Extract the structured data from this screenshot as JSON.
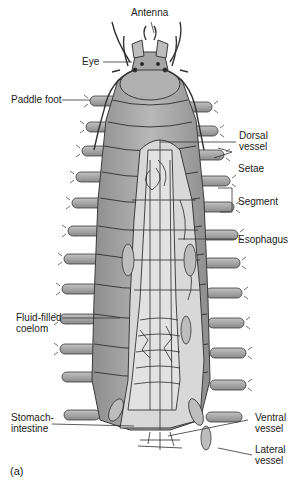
{
  "figure": {
    "panel_label": "(a)",
    "colors": {
      "body": "#a9a9a9",
      "body_shadow": "#8e8e8e",
      "interior": "#d6d6d6",
      "outline": "#3a3a3a",
      "vessel": "#2b2b2b",
      "label_text": "#222222"
    }
  },
  "labels": [
    {
      "id": "antenna",
      "text": "Antenna",
      "side": "top"
    },
    {
      "id": "eye",
      "text": "Eye",
      "side": "left"
    },
    {
      "id": "paddle_foot",
      "text": "Paddle foot",
      "side": "left"
    },
    {
      "id": "dorsal_vessel",
      "text": "Dorsal\nvessel",
      "line1": "Dorsal",
      "line2": "vessel",
      "side": "right"
    },
    {
      "id": "setae",
      "text": "Setae",
      "side": "right"
    },
    {
      "id": "segment",
      "text": "Segment",
      "side": "right"
    },
    {
      "id": "esophagus",
      "text": "Esophagus",
      "side": "right"
    },
    {
      "id": "fluid_filled_coelom",
      "text": "Fluid-filled coelom",
      "line1": "Fluid-filled",
      "line2": "coelom",
      "side": "left"
    },
    {
      "id": "stomach_intestine",
      "text": "Stomach-intestine",
      "line1": "Stomach-",
      "line2": "intestine",
      "side": "left"
    },
    {
      "id": "ventral_vessel",
      "text": "Ventral vessel",
      "line1": "Ventral",
      "line2": "vessel",
      "side": "right"
    },
    {
      "id": "lateral_vessel",
      "text": "Lateral vessel",
      "line1": "Lateral",
      "line2": "vessel",
      "side": "right"
    }
  ]
}
